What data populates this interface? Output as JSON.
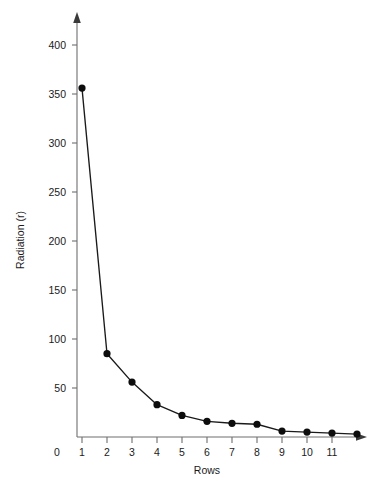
{
  "chart_data": {
    "type": "line",
    "title": "",
    "subtitle": "",
    "xlabel": "Rows",
    "ylabel": "Radiation (r)",
    "x": [
      1,
      2,
      3,
      4,
      5,
      6,
      7,
      8,
      9,
      10,
      11,
      12
    ],
    "values": [
      356,
      85,
      56,
      33,
      22,
      16,
      14,
      13,
      6,
      5,
      4,
      3
    ],
    "series": [
      {
        "name": "Radiation",
        "values": [
          356,
          85,
          56,
          33,
          22,
          16,
          14,
          13,
          6,
          5,
          4,
          3
        ]
      }
    ],
    "xlim": [
      0,
      13
    ],
    "ylim": [
      0,
      425
    ],
    "xticks": [
      0,
      1,
      2,
      3,
      4,
      5,
      6,
      7,
      8,
      9,
      10,
      11,
      12
    ],
    "xtick_labels": [
      "0",
      "1",
      "2",
      "3",
      "4",
      "5",
      "6",
      "7",
      "8",
      "9",
      "10",
      "11",
      "12"
    ],
    "yticks": [
      50,
      100,
      150,
      200,
      250,
      300,
      350,
      400
    ],
    "ytick_labels": [
      "50",
      "100",
      "150",
      "200",
      "250",
      "300",
      "350",
      "400"
    ],
    "grid": false,
    "legend": false,
    "legend_position": "none",
    "marker": "filled-circle",
    "line_color": "#1a1a1a",
    "marker_color": "#0d0d0d",
    "axis_color": "#6e6e6e",
    "background_color": "#ffffff",
    "axis_arrows": true,
    "annotations": []
  }
}
